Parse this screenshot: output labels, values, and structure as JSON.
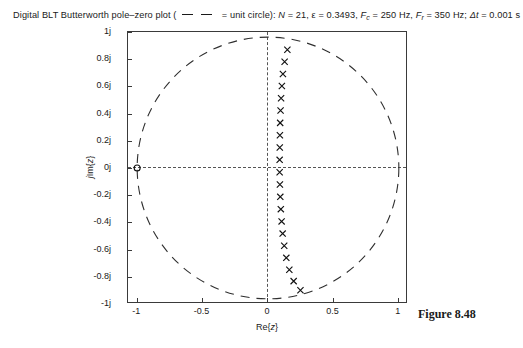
{
  "title": {
    "prefix": "Digital BLT Butterworth pole–zero plot (",
    "legend_text": "= unit circle):",
    "params": [
      {
        "sym": "N",
        "val": "= 21",
        "sep": ","
      },
      {
        "sym": "ε",
        "val": "= 0.3493",
        "sep": ","
      },
      {
        "sym": "F",
        "sub": "c",
        "val": "= 250 Hz",
        "sep": ","
      },
      {
        "sym": "F",
        "sub": "r",
        "val": "= 350 Hz",
        "sep": ";"
      },
      {
        "sym": "Δt",
        "val": "= 0.001 s",
        "sep": ""
      }
    ],
    "full_text": "Digital BLT Butterworth pole–zero plot ( —  — = unit circle): N = 21, ε = 0.3493, Fc = 250 Hz, Fr = 350 Hz; Δt = 0.001 s"
  },
  "figure_caption": "Figure 8.48",
  "axes": {
    "xlabel_prefix": "Re{",
    "xlabel_var": "z",
    "xlabel_suffix": "}",
    "xlabel": "Re{z}",
    "ylabel_prefix": "j",
    "ylabel_mid": "Im{",
    "ylabel_var": "z",
    "ylabel_suffix": "}",
    "ylabel": "jIm{z}",
    "xticks": [
      "-1",
      "-0.5",
      "0",
      "0.5",
      "1"
    ],
    "xtick_values": [
      -1,
      -0.5,
      0,
      0.5,
      1
    ],
    "yticks": [
      "1j",
      "0.8j",
      "0.6j",
      "0.4j",
      "0.2j",
      "0j",
      "-0.2j",
      "-0.4j",
      "-0.6j",
      "-0.8j",
      "-1j"
    ],
    "ytick_values": [
      1,
      0.8,
      0.6,
      0.4,
      0.2,
      0,
      -0.2,
      -0.4,
      -0.6,
      -0.8,
      -1
    ],
    "xlim": [
      -1.07,
      1.07
    ],
    "ylim": [
      -1.07,
      1.07
    ]
  },
  "chart_data": {
    "type": "scatter",
    "xlabel": "Re{z}",
    "ylabel": "jIm{z}",
    "xlim": [
      -1.07,
      1.07
    ],
    "ylim": [
      -1.07,
      1.07
    ],
    "grid": false,
    "legend": "—  — = unit circle",
    "parameters": {
      "N": 21,
      "epsilon": 0.3493,
      "Fc_Hz": 250,
      "Fr_Hz": 350,
      "dt_s": 0.001
    },
    "series": [
      {
        "name": "poles",
        "marker": "x",
        "count": 21,
        "points": [
          [
            0.148,
            0.93
          ],
          [
            0.127,
            0.836
          ],
          [
            0.114,
            0.74
          ],
          [
            0.106,
            0.645
          ],
          [
            0.1,
            0.549
          ],
          [
            0.096,
            0.452
          ],
          [
            0.093,
            0.355
          ],
          [
            0.091,
            0.258
          ],
          [
            0.09,
            0.161
          ],
          [
            0.089,
            0.064
          ],
          [
            0.089,
            -0.033
          ],
          [
            0.091,
            -0.13
          ],
          [
            0.094,
            -0.227
          ],
          [
            0.098,
            -0.324
          ],
          [
            0.104,
            -0.42
          ],
          [
            0.112,
            -0.516
          ],
          [
            0.124,
            -0.612
          ],
          [
            0.14,
            -0.707
          ],
          [
            0.163,
            -0.8
          ],
          [
            0.196,
            -0.89
          ],
          [
            0.248,
            -0.962
          ]
        ]
      },
      {
        "name": "zeros",
        "marker": "o",
        "count": 1,
        "points": [
          [
            -1.0,
            0.0
          ]
        ],
        "multiplicity": 21
      },
      {
        "name": "unit circle",
        "marker": "dashed",
        "radius": 1.0,
        "center": [
          0,
          0
        ]
      }
    ]
  }
}
